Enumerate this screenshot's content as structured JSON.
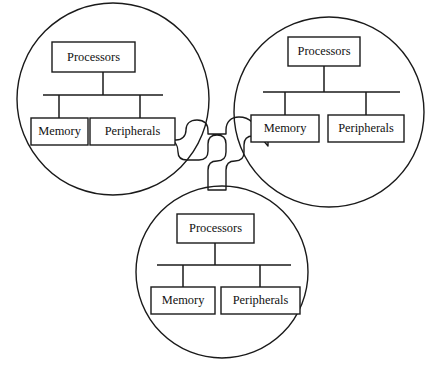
{
  "diagram": {
    "stroke_color": "#1a1a1a",
    "background_color": "#ffffff",
    "fill_color": "#ffffff",
    "node_count": 3,
    "nodes": [
      {
        "id": "node-left",
        "position": "left",
        "circle": {
          "cx": 113,
          "cy": 99,
          "r": 96
        },
        "components": [
          {
            "name": "processors",
            "label": "Processors",
            "x": 52,
            "y": 42,
            "w": 83,
            "h": 30
          },
          {
            "name": "memory",
            "label": "Memory",
            "x": 31,
            "y": 118,
            "w": 57,
            "h": 27
          },
          {
            "name": "peripherals",
            "label": "Peripherals",
            "x": 90,
            "y": 118,
            "w": 85,
            "h": 27
          }
        ],
        "bus": {
          "x1": 43,
          "x2": 163,
          "y": 95
        }
      },
      {
        "id": "node-right",
        "position": "right",
        "circle": {
          "cx": 329,
          "cy": 112,
          "r": 95
        },
        "components": [
          {
            "name": "processors",
            "label": "Processors",
            "x": 288,
            "y": 37,
            "w": 72,
            "h": 29
          },
          {
            "name": "memory",
            "label": "Memory",
            "x": 251,
            "y": 115,
            "w": 68,
            "h": 27
          },
          {
            "name": "peripherals",
            "label": "Peripherals",
            "x": 328,
            "y": 115,
            "w": 76,
            "h": 27
          }
        ],
        "bus": {
          "x1": 263,
          "x2": 400,
          "y": 92
        }
      },
      {
        "id": "node-bottom",
        "position": "bottom",
        "circle": {
          "cx": 222,
          "cy": 272,
          "r": 86
        },
        "components": [
          {
            "name": "processors",
            "label": "Processors",
            "x": 177,
            "y": 214,
            "w": 77,
            "h": 29
          },
          {
            "name": "memory",
            "label": "Memory",
            "x": 151,
            "y": 287,
            "w": 64,
            "h": 27
          },
          {
            "name": "peripherals",
            "label": "Peripherals",
            "x": 221,
            "y": 287,
            "w": 79,
            "h": 27
          }
        ],
        "bus": {
          "x1": 157,
          "x2": 291,
          "y": 265
        }
      }
    ],
    "connector": {
      "name": "inter-node-link",
      "description": "Rounded pipe junction linking the three node circles"
    }
  }
}
